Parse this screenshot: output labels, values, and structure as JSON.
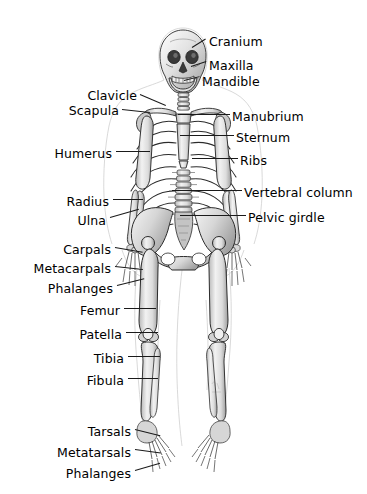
{
  "figure": {
    "background_color": "#ffffff",
    "text_color": "#000000",
    "leader_color": "#1a1a1a",
    "bone_fill": "#e9e9e9",
    "bone_shade": "#9a9a9a",
    "bone_outline": "#2b2b2b",
    "body_outline": "#c8c8c8",
    "width": 367,
    "height": 494
  },
  "labels": [
    {
      "id": "cranium",
      "text": "Cranium",
      "side": "right",
      "x": 209,
      "y": 36,
      "lx": 192,
      "ly": 47,
      "len": 16,
      "angle": -32
    },
    {
      "id": "maxilla",
      "text": "Maxilla",
      "side": "right",
      "x": 209,
      "y": 60,
      "lx": 191,
      "ly": 66,
      "len": 16,
      "angle": -18
    },
    {
      "id": "mandible",
      "text": "Mandible",
      "side": "right",
      "x": 202,
      "y": 76,
      "lx": 184,
      "ly": 80,
      "len": 16,
      "angle": -14
    },
    {
      "id": "manubrium",
      "text": "Manubrium",
      "side": "right",
      "x": 232,
      "y": 111,
      "lx": 178,
      "ly": 114,
      "len": 52,
      "angle": 0
    },
    {
      "id": "sternum",
      "text": "Sternum",
      "side": "right",
      "x": 236,
      "y": 132,
      "lx": 180,
      "ly": 135,
      "len": 54,
      "angle": 0
    },
    {
      "id": "ribs",
      "text": "Ribs",
      "side": "right",
      "x": 240,
      "y": 155,
      "lx": 192,
      "ly": 158,
      "len": 46,
      "angle": 0
    },
    {
      "id": "vertebral-column",
      "text": "Vertebral column",
      "side": "right",
      "x": 244,
      "y": 187,
      "lx": 172,
      "ly": 190,
      "len": 70,
      "angle": 0
    },
    {
      "id": "pelvic-girdle",
      "text": "Pelvic girdle",
      "side": "right",
      "x": 248,
      "y": 212,
      "lx": 180,
      "ly": 215,
      "len": 66,
      "angle": 0
    },
    {
      "id": "clavicle",
      "text": "Clavicle",
      "side": "left",
      "x": 137,
      "y": 90,
      "lx": 140,
      "ly": 94,
      "len": 28,
      "angle": 23
    },
    {
      "id": "scapula",
      "text": "Scapula",
      "side": "left",
      "x": 119,
      "y": 105,
      "lx": 122,
      "ly": 109,
      "len": 28,
      "angle": 6
    },
    {
      "id": "humerus",
      "text": "Humerus",
      "side": "left",
      "x": 112,
      "y": 148,
      "lx": 116,
      "ly": 151,
      "len": 34,
      "angle": 0
    },
    {
      "id": "radius",
      "text": "Radius",
      "side": "left",
      "x": 109,
      "y": 196,
      "lx": 113,
      "ly": 199,
      "len": 30,
      "angle": 0
    },
    {
      "id": "ulna",
      "text": "Ulna",
      "side": "left",
      "x": 106,
      "y": 215,
      "lx": 110,
      "ly": 217,
      "len": 30,
      "angle": -16
    },
    {
      "id": "carpals",
      "text": "Carpals",
      "side": "left",
      "x": 111,
      "y": 244,
      "lx": 115,
      "ly": 247,
      "len": 28,
      "angle": 10
    },
    {
      "id": "metacarpals",
      "text": "Metacarpals",
      "side": "left",
      "x": 111,
      "y": 263,
      "lx": 115,
      "ly": 266,
      "len": 28,
      "angle": 6
    },
    {
      "id": "phalanges-hand",
      "text": "Phalanges",
      "side": "left",
      "x": 113,
      "y": 283,
      "lx": 117,
      "ly": 285,
      "len": 28,
      "angle": -14
    },
    {
      "id": "femur",
      "text": "Femur",
      "side": "left",
      "x": 120,
      "y": 305,
      "lx": 124,
      "ly": 308,
      "len": 32,
      "angle": 0
    },
    {
      "id": "patella",
      "text": "Patella",
      "side": "left",
      "x": 122,
      "y": 329,
      "lx": 126,
      "ly": 332,
      "len": 32,
      "angle": 0
    },
    {
      "id": "tibia",
      "text": "Tibia",
      "side": "left",
      "x": 124,
      "y": 353,
      "lx": 128,
      "ly": 356,
      "len": 32,
      "angle": 0
    },
    {
      "id": "fibula",
      "text": "Fibula",
      "side": "left",
      "x": 124,
      "y": 375,
      "lx": 128,
      "ly": 378,
      "len": 30,
      "angle": 0
    },
    {
      "id": "tarsals",
      "text": "Tarsals",
      "side": "left",
      "x": 131,
      "y": 426,
      "lx": 135,
      "ly": 429,
      "len": 26,
      "angle": 14
    },
    {
      "id": "metatarsals",
      "text": "Metatarsals",
      "side": "left",
      "x": 131,
      "y": 447,
      "lx": 135,
      "ly": 449,
      "len": 26,
      "angle": 8
    },
    {
      "id": "phalanges-foot",
      "text": "Phalanges",
      "side": "left",
      "x": 131,
      "y": 468,
      "lx": 135,
      "ly": 470,
      "len": 26,
      "angle": -16
    }
  ]
}
